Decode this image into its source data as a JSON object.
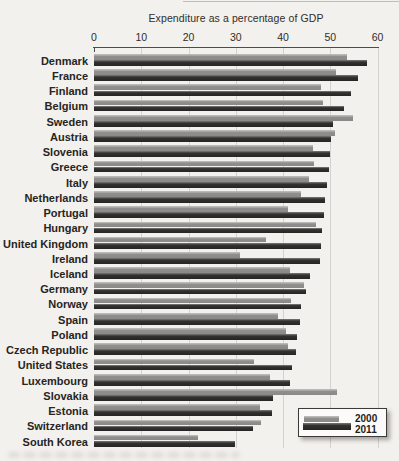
{
  "chart_data": {
    "type": "bar",
    "orientation": "horizontal",
    "title": "Expenditure as a percentage of GDP",
    "x_axis": {
      "min": 0,
      "max": 60,
      "tick_interval": 10,
      "ticks": [
        0,
        10,
        20,
        30,
        40,
        50,
        60
      ],
      "position": "top"
    },
    "grid": true,
    "legend_position": "bottom-right",
    "categories": [
      "Denmark",
      "France",
      "Finland",
      "Belgium",
      "Sweden",
      "Austria",
      "Slovenia",
      "Greece",
      "Italy",
      "Netherlands",
      "Portugal",
      "Hungary",
      "United Kingdom",
      "Ireland",
      "Iceland",
      "Germany",
      "Norway",
      "Spain",
      "Poland",
      "Czech Republic",
      "United States",
      "Luxembourg",
      "Slovakia",
      "Estonia",
      "Switzerland",
      "South Korea"
    ],
    "series": [
      {
        "name": "2000",
        "color": "#8f8e8c",
        "values": [
          53.6,
          51.2,
          48.0,
          48.5,
          54.9,
          51.1,
          46.3,
          46.6,
          45.4,
          43.9,
          41.1,
          47.0,
          36.5,
          30.9,
          41.4,
          44.4,
          41.6,
          38.9,
          40.6,
          41.0,
          33.8,
          37.2,
          51.4,
          35.2,
          35.4,
          22.1
        ]
      },
      {
        "name": "2011",
        "color": "#2a2927",
        "values": [
          57.7,
          55.8,
          54.4,
          52.9,
          50.6,
          50.2,
          49.9,
          49.7,
          49.4,
          48.9,
          48.6,
          48.3,
          48.0,
          47.9,
          45.8,
          44.8,
          43.9,
          43.7,
          42.9,
          42.7,
          42.0,
          41.4,
          37.8,
          37.7,
          33.7,
          29.8
        ]
      }
    ]
  }
}
